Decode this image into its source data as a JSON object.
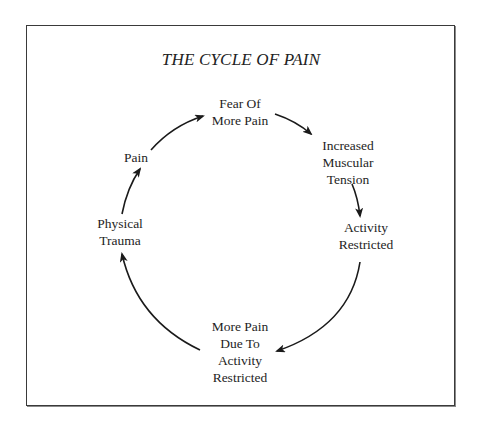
{
  "diagram": {
    "title": "THE CYCLE OF PAIN",
    "type": "cycle",
    "nodes": [
      {
        "id": "fear",
        "lines": [
          "Fear Of",
          "More Pain"
        ]
      },
      {
        "id": "tension",
        "lines": [
          "Increased",
          "Muscular",
          "Tension"
        ]
      },
      {
        "id": "activity",
        "lines": [
          "Activity",
          "Restricted"
        ]
      },
      {
        "id": "more_pain",
        "lines": [
          "More Pain",
          "Due To",
          "Activity",
          "Restricted"
        ]
      },
      {
        "id": "trauma",
        "lines": [
          "Physical",
          "Trauma"
        ]
      },
      {
        "id": "pain",
        "lines": [
          "Pain"
        ]
      }
    ],
    "edges": [
      {
        "from": "pain",
        "to": "fear"
      },
      {
        "from": "fear",
        "to": "tension"
      },
      {
        "from": "tension",
        "to": "activity"
      },
      {
        "from": "activity",
        "to": "more_pain"
      },
      {
        "from": "more_pain",
        "to": "trauma"
      },
      {
        "from": "trauma",
        "to": "pain"
      }
    ],
    "colors": {
      "stroke": "#1a1a1a",
      "border": "#3a3a3a",
      "background": "#ffffff"
    }
  }
}
